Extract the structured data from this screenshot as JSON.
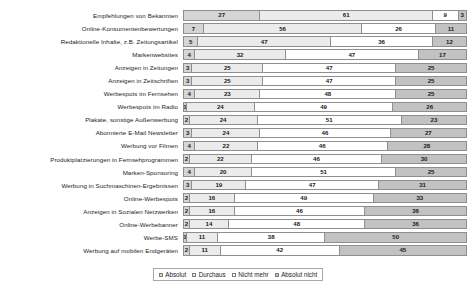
{
  "legend": {
    "position": "bottom-center",
    "entries": [
      {
        "label": "Absolut",
        "color": "#d5d5d5",
        "swatch": "legend-swatch-icon"
      },
      {
        "label": "Durchaus",
        "color": "#ebebeb",
        "swatch": "legend-swatch-icon"
      },
      {
        "label": "Nicht mehr",
        "color": "#ffffff",
        "swatch": "legend-swatch-icon"
      },
      {
        "label": "Absolut nicht",
        "color": "#c2c2c2",
        "swatch": "legend-swatch-icon"
      }
    ]
  },
  "chart_data": {
    "type": "bar",
    "title": "",
    "subtitle": "",
    "xlabel": "",
    "ylabel": "",
    "xlim": [
      0,
      100
    ],
    "grid": false,
    "stacked": true,
    "orientation": "horizontal",
    "normalized_percent": true,
    "legend_position": "bottom-center",
    "series_names": [
      "Absolut",
      "Durchaus",
      "Nicht mehr",
      "Absolut nicht"
    ],
    "series_colors": [
      "#d5d5d5",
      "#ebebeb",
      "#ffffff",
      "#c2c2c2"
    ],
    "categories": [
      "Empfehlungen von Bekannten",
      "Online-Konsumentenbewertungen",
      "Redaktionelle Inhalte, z.B. Zeitungsartikel",
      "Markenwebsites",
      "Anzeigen in Zeitungen",
      "Anzeigen in Zeitschriften",
      "Werbespots im Fernsehen",
      "Werbespots im Radio",
      "Plakate, sonstige Außenwerbung",
      "Abonnierte E-Mail Newsletter",
      "Werbung vor Filmen",
      "Produktplatzierungen in Fernsehprogrammen",
      "Marken-Sponsoring",
      "Werbung in Suchmaschinen-Ergebnissen",
      "Online-Werbespots",
      "Anzeigen in Sozialen Netzwerken",
      "Online-Werbebanner",
      "Werbe-SMS",
      "Werbung auf mobilen Endgeräten"
    ],
    "series": [
      {
        "name": "Absolut",
        "values": [
          27,
          7,
          5,
          4,
          3,
          3,
          4,
          1,
          2,
          3,
          4,
          2,
          4,
          3,
          2,
          2,
          2,
          1,
          2
        ]
      },
      {
        "name": "Durchaus",
        "values": [
          61,
          56,
          47,
          32,
          25,
          25,
          23,
          24,
          24,
          24,
          22,
          22,
          20,
          19,
          16,
          16,
          14,
          11,
          11
        ]
      },
      {
        "name": "Nicht mehr",
        "values": [
          9,
          26,
          36,
          47,
          47,
          47,
          48,
          49,
          51,
          46,
          46,
          46,
          51,
          47,
          49,
          46,
          48,
          38,
          42
        ]
      },
      {
        "name": "Absolut nicht",
        "values": [
          3,
          11,
          12,
          17,
          25,
          25,
          25,
          26,
          23,
          27,
          28,
          30,
          25,
          31,
          33,
          36,
          36,
          50,
          45
        ]
      }
    ]
  }
}
